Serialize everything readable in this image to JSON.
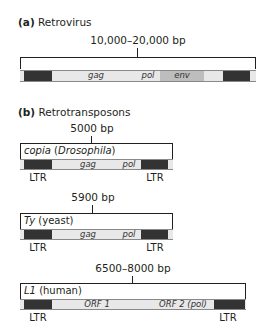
{
  "retrovirus": {
    "label_letter": "(a)",
    "label_text": "Retrovirus",
    "size": "10,000–20,000 bp",
    "genes": [
      "gag",
      "pol",
      "env"
    ]
  },
  "retrotransposons": {
    "label_letter": "(b)",
    "label_text": "Retrotransposons",
    "elements": [
      {
        "name": "copia",
        "organism": "(Drosophila)",
        "size": "5000 bp",
        "genes": [
          "gag",
          "pol"
        ],
        "ltr_left": "LTR",
        "ltr_right": "LTR"
      },
      {
        "name": "Ty",
        "organism": "(yeast)",
        "size": "5900 bp",
        "genes": [
          "gag",
          "pol"
        ],
        "ltr_left": "LTR",
        "ltr_right": "LTR"
      },
      {
        "name": "L1",
        "organism": "(human)",
        "size": "6500–8000 bp",
        "genes": [
          "ORF 1",
          "ORF 2 (pol)"
        ],
        "ltr_left": "LTR",
        "ltr_right": "LTR"
      }
    ]
  },
  "colors": {
    "ltr": "#333333",
    "bar": "#e8e8e8",
    "env": "#bdbdbd"
  }
}
